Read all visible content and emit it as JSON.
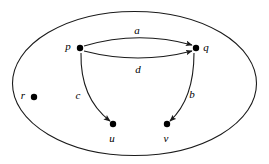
{
  "diagram": {
    "type": "directed-graph",
    "title": "",
    "boundary": {
      "shape": "ellipse",
      "cx": 134.5,
      "cy": 83.5,
      "rx": 122,
      "ry": 72
    },
    "vertices": [
      {
        "id": "p",
        "label": "p",
        "x": 80,
        "y": 48,
        "label_x": 68,
        "label_y": 47
      },
      {
        "id": "q",
        "label": "q",
        "x": 196,
        "y": 48,
        "label_x": 206,
        "label_y": 48
      },
      {
        "id": "r",
        "label": "r",
        "x": 34,
        "y": 97,
        "label_x": 23,
        "label_y": 96
      },
      {
        "id": "u",
        "label": "u",
        "x": 113,
        "y": 124,
        "label_x": 112,
        "label_y": 139
      },
      {
        "id": "v",
        "label": "v",
        "x": 167,
        "y": 124,
        "label_x": 166,
        "label_y": 139
      }
    ],
    "edges": [
      {
        "id": "a",
        "label": "a",
        "from": "p",
        "to": "q",
        "directed": true,
        "path": "M 84 46 Q 138 30 192 45",
        "label_x": 137,
        "label_y": 31
      },
      {
        "id": "d",
        "label": "d",
        "from": "p",
        "to": "q",
        "directed": true,
        "path": "M 84 51 Q 138 65 192 51",
        "label_x": 138,
        "label_y": 70
      },
      {
        "id": "c",
        "label": "c",
        "from": "p",
        "to": "u",
        "directed": true,
        "path": "M 81 53 Q 80 98 110 121",
        "label_x": 78,
        "label_y": 96
      },
      {
        "id": "b",
        "label": "b",
        "from": "q",
        "to": "v",
        "directed": true,
        "path": "M 194 53 Q 194 99 170 121",
        "label_x": 192,
        "label_y": 95
      }
    ],
    "colors": {
      "background": "#ffffff",
      "stroke": "#1a1a1a",
      "vertex": "#000000",
      "text": "#000000"
    }
  }
}
